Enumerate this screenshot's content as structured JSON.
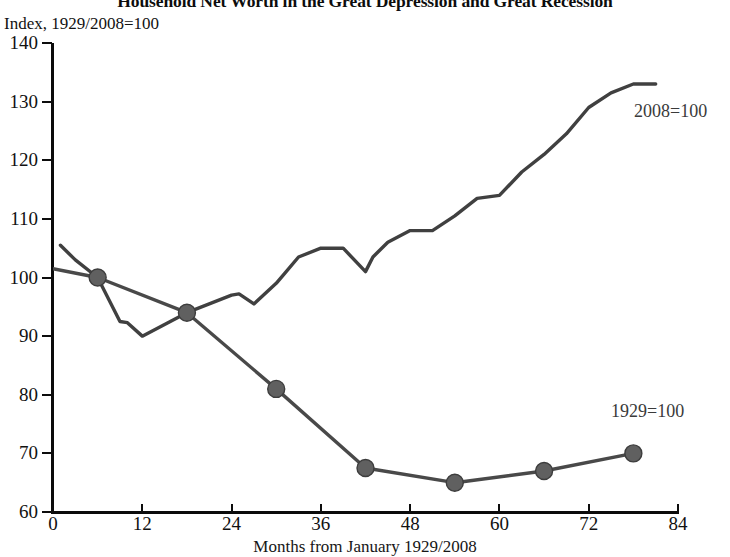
{
  "chart_data": {
    "type": "line",
    "title": "Household Net Worth in the Great Depression and Great Recession",
    "subtitle": "Index, 1929/2008=100",
    "xlabel": "Months from January 1929/2008",
    "ylabel": "",
    "xlim": [
      0,
      84
    ],
    "ylim": [
      60,
      140
    ],
    "xticks": [
      0,
      12,
      24,
      36,
      48,
      60,
      72,
      84
    ],
    "yticks": [
      60,
      70,
      80,
      90,
      100,
      110,
      120,
      130,
      140
    ],
    "grid": false,
    "legend": "inline-annotations",
    "series": [
      {
        "name": "2008=100",
        "color": "#404040",
        "annotation": "2008=100",
        "marker": "none",
        "x": [
          1,
          3,
          6,
          9,
          10,
          12,
          15,
          18,
          21,
          24,
          25,
          27,
          30,
          31,
          33,
          36,
          38,
          39,
          42,
          43,
          45,
          48,
          51,
          54,
          57,
          60,
          63,
          66,
          69,
          72,
          75,
          78,
          81
        ],
        "y": [
          105.5,
          103.0,
          100.0,
          92.5,
          92.3,
          90.0,
          92.0,
          94.0,
          95.5,
          97.0,
          97.2,
          95.5,
          99.0,
          100.5,
          103.5,
          105.0,
          105.0,
          105.0,
          101.0,
          103.5,
          106.0,
          108.0,
          108.0,
          110.5,
          113.5,
          114.0,
          118.0,
          121.0,
          124.5,
          129.0,
          131.5,
          133.0,
          133.0
        ]
      },
      {
        "name": "1929=100",
        "color": "#494949",
        "annotation": "1929=100",
        "marker": "circle",
        "x": [
          0,
          6,
          18,
          30,
          42,
          54,
          66,
          78
        ],
        "y": [
          101.5,
          100.0,
          94.0,
          81.0,
          67.5,
          65.0,
          67.0,
          70.0
        ]
      }
    ]
  }
}
